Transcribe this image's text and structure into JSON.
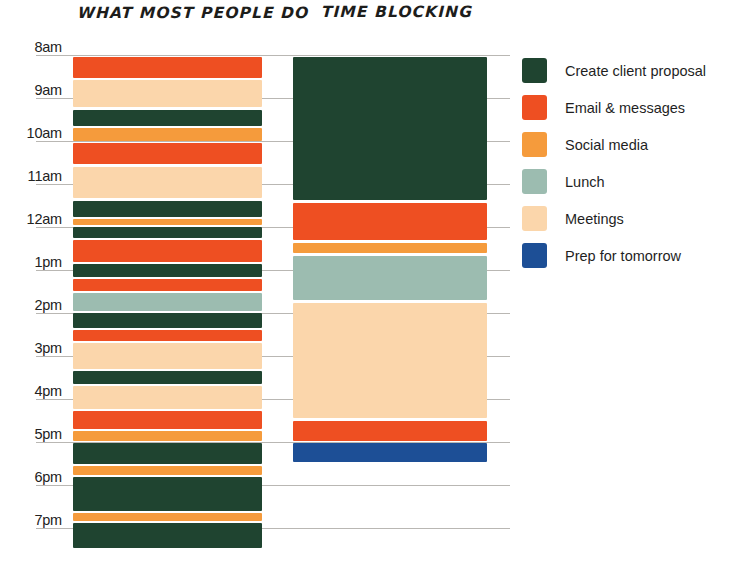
{
  "columns": {
    "left_title": "WHAT MOST PEOPLE DO",
    "right_title": "TIME BLOCKING"
  },
  "legend": {
    "items": [
      {
        "label": "Create client proposal",
        "color": "#1f4430"
      },
      {
        "label": "Email & messages",
        "color": "#ee4f22"
      },
      {
        "label": "Social media",
        "color": "#f59b3c"
      },
      {
        "label": "Lunch",
        "color": "#9cbcb0"
      },
      {
        "label": "Meetings",
        "color": "#fbd6ab"
      },
      {
        "label": "Prep for tomorrow",
        "color": "#1d4f96"
      }
    ]
  },
  "chart_data": {
    "type": "bar",
    "xlabel": "",
    "ylabel": "Time of day",
    "grid": true,
    "legend_position": "right",
    "orientation": "vertical-timeline",
    "axis_ticks": [
      "8am",
      "9am",
      "10am",
      "11am",
      "12am",
      "1pm",
      "2pm",
      "3pm",
      "4pm",
      "5pm",
      "6pm",
      "7pm"
    ],
    "axis_range": [
      "8am",
      "7pm"
    ],
    "categories": [
      "WHAT MOST PEOPLE DO",
      "TIME BLOCKING"
    ],
    "series": [
      {
        "name": "WHAT MOST PEOPLE DO",
        "blocks": [
          {
            "task": "Email & messages",
            "color": "#ee4f22",
            "start": "8:05am",
            "end": "8:30am"
          },
          {
            "task": "Meetings",
            "color": "#fbd6ab",
            "start": "8:35am",
            "end": "9:10am"
          },
          {
            "task": "Create client proposal",
            "color": "#1f4430",
            "start": "9:17am",
            "end": "9:38am"
          },
          {
            "task": "Social media",
            "color": "#f59b3c",
            "start": "9:41am",
            "end": "9:58am"
          },
          {
            "task": "Email & messages",
            "color": "#ee4f22",
            "start": "10:02am",
            "end": "10:30am"
          },
          {
            "task": "Meetings",
            "color": "#fbd6ab",
            "start": "10:36am",
            "end": "11:19am"
          },
          {
            "task": "Create client proposal",
            "color": "#1f4430",
            "start": "11:24am",
            "end": "11:45am"
          },
          {
            "task": "Social media",
            "color": "#f59b3c",
            "start": "11:47am",
            "end": "11:54am"
          },
          {
            "task": "Create client proposal",
            "color": "#1f4430",
            "start": "11:58am",
            "end": "12:12pm"
          },
          {
            "task": "Email & messages",
            "color": "#ee4f22",
            "start": "12:15pm",
            "end": "12:44pm"
          },
          {
            "task": "Create client proposal",
            "color": "#1f4430",
            "start": "12:47pm",
            "end": "1:04pm"
          },
          {
            "task": "Email & messages",
            "color": "#ee4f22",
            "start": "1:06pm",
            "end": "1:22pm"
          },
          {
            "task": "Lunch",
            "color": "#9cbcb0",
            "start": "1:26pm",
            "end": "1:50pm"
          },
          {
            "task": "Create client proposal",
            "color": "#1f4430",
            "start": "1:54pm",
            "end": "2:14pm"
          },
          {
            "task": "Email & messages",
            "color": "#ee4f22",
            "start": "2:16pm",
            "end": "2:30pm"
          },
          {
            "task": "Meetings",
            "color": "#fbd6ab",
            "start": "2:33pm",
            "end": "3:08pm"
          },
          {
            "task": "Create client proposal",
            "color": "#1f4430",
            "start": "3:12pm",
            "end": "3:29pm"
          },
          {
            "task": "Meetings",
            "color": "#fbd6ab",
            "start": "3:33pm",
            "end": "4:04pm"
          },
          {
            "task": "Email & messages",
            "color": "#ee4f22",
            "start": "4:08pm",
            "end": "4:32pm"
          },
          {
            "task": "Social media",
            "color": "#f59b3c",
            "start": "4:34pm",
            "end": "4:47pm"
          },
          {
            "task": "Create client proposal",
            "color": "#1f4430",
            "start": "4:51pm",
            "end": "5:19pm"
          },
          {
            "task": "Social media",
            "color": "#f59b3c",
            "start": "5:21pm",
            "end": "5:33pm"
          },
          {
            "task": "Create client proposal",
            "color": "#1f4430",
            "start": "5:37pm",
            "end": "6:22pm"
          },
          {
            "task": "Social media",
            "color": "#f59b3c",
            "start": "6:25pm",
            "end": "6:36pm"
          },
          {
            "task": "Create client proposal",
            "color": "#1f4430",
            "start": "6:41pm",
            "end": "7:00pm"
          }
        ]
      },
      {
        "name": "TIME BLOCKING",
        "blocks": [
          {
            "task": "Create client proposal",
            "color": "#1f4430",
            "start": "8:05am",
            "end": "11:25am"
          },
          {
            "task": "Email & messages",
            "color": "#ee4f22",
            "start": "11:30am",
            "end": "12:22pm"
          },
          {
            "task": "Social media",
            "color": "#f59b3c",
            "start": "12:26pm",
            "end": "12:40pm"
          },
          {
            "task": "Lunch",
            "color": "#9cbcb0",
            "start": "12:43pm",
            "end": "1:45pm"
          },
          {
            "task": "Meetings",
            "color": "#fbd6ab",
            "start": "1:50pm",
            "end": "4:26pm"
          },
          {
            "task": "Email & messages",
            "color": "#ee4f22",
            "start": "4:29pm",
            "end": "4:57pm"
          },
          {
            "task": "Prep for tomorrow",
            "color": "#1d4f96",
            "start": "5:00pm",
            "end": "5:27pm"
          }
        ]
      }
    ]
  },
  "geometry": {
    "axis_top_y": 55,
    "hour_height": 43,
    "grid_left": 36,
    "grid_width": 474,
    "left_col_x": 73,
    "left_col_w": 189,
    "right_col_x": 293,
    "right_col_w": 194,
    "hours": [
      8,
      9,
      10,
      11,
      12,
      13,
      14,
      15,
      16,
      17,
      18,
      19
    ],
    "left_segments": [
      [
        "#ee4f22",
        57,
        21
      ],
      [
        "#fbd6ab",
        80,
        27
      ],
      [
        "#1f4430",
        110,
        16
      ],
      [
        "#f59b3c",
        128,
        13
      ],
      [
        "#ee4f22",
        143,
        21
      ],
      [
        "#fbd6ab",
        167,
        31
      ],
      [
        "#1f4430",
        201,
        16
      ],
      [
        "#f59b3c",
        219,
        6
      ],
      [
        "#1f4430",
        227,
        11
      ],
      [
        "#ee4f22",
        240,
        22
      ],
      [
        "#1f4430",
        264,
        13
      ],
      [
        "#ee4f22",
        279,
        12
      ],
      [
        "#9cbcb0",
        293,
        18
      ],
      [
        "#1f4430",
        313,
        15
      ],
      [
        "#ee4f22",
        330,
        11
      ],
      [
        "#fbd6ab",
        343,
        26
      ],
      [
        "#1f4430",
        371,
        13
      ],
      [
        "#fbd6ab",
        386,
        23
      ],
      [
        "#ee4f22",
        411,
        18
      ],
      [
        "#f59b3c",
        431,
        10
      ],
      [
        "#1f4430",
        443,
        21
      ],
      [
        "#f59b3c",
        466,
        9
      ],
      [
        "#1f4430",
        477,
        34
      ],
      [
        "#f59b3c",
        513,
        8
      ],
      [
        "#1f4430",
        523,
        25
      ]
    ],
    "right_segments": [
      [
        "#1f4430",
        57,
        143
      ],
      [
        "#ee4f22",
        203,
        37
      ],
      [
        "#f59b3c",
        243,
        10
      ],
      [
        "#9cbcb0",
        256,
        44
      ],
      [
        "#fbd6ab",
        303,
        115
      ],
      [
        "#ee4f22",
        421,
        20
      ],
      [
        "#1d4f96",
        443,
        19
      ]
    ]
  }
}
